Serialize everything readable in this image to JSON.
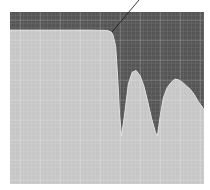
{
  "figure": {
    "caption_visible": false,
    "colors": {
      "background": "#ffffff",
      "stopband_region": "#565656",
      "grid_dark_minor": "#6e6e6e",
      "grid_dark_major": "#8a8a8a",
      "response_fill": "#c6c6c6",
      "grid_light_minor": "#d4d4d4",
      "grid_light_major": "#dadada",
      "curve_edge": "#e2e2e2",
      "leader_line": "#222222"
    },
    "plot_area": {
      "x": 10,
      "y": 12,
      "width": 194,
      "height": 172
    },
    "annotation": {
      "leader_line": {
        "x1": 112,
        "y1": 32,
        "x2": 139,
        "y2": 0
      },
      "label_text": ""
    }
  },
  "chart_data": {
    "type": "area",
    "title": "",
    "xlabel": "",
    "ylabel": "",
    "grid": true,
    "legend": null,
    "x": [
      0.0,
      0.1,
      0.2,
      0.3,
      0.4,
      0.5,
      0.52,
      0.53,
      0.545,
      0.555,
      0.565,
      0.575,
      0.59,
      0.61,
      0.63,
      0.65,
      0.67,
      0.69,
      0.71,
      0.73,
      0.75,
      0.76,
      0.775,
      0.79,
      0.81,
      0.83,
      0.85,
      0.87,
      0.89,
      0.91,
      0.93,
      0.95,
      0.97,
      0.99,
      1.0
    ],
    "series": [
      {
        "name": "response",
        "values": [
          0.895,
          0.895,
          0.895,
          0.895,
          0.895,
          0.893,
          0.885,
          0.87,
          0.8,
          0.62,
          0.4,
          0.28,
          0.4,
          0.58,
          0.65,
          0.66,
          0.63,
          0.57,
          0.48,
          0.38,
          0.3,
          0.28,
          0.4,
          0.5,
          0.56,
          0.59,
          0.61,
          0.605,
          0.59,
          0.57,
          0.55,
          0.52,
          0.48,
          0.45,
          0.43
        ]
      }
    ],
    "ylim": [
      0,
      1
    ],
    "xlim": [
      0,
      1
    ]
  }
}
